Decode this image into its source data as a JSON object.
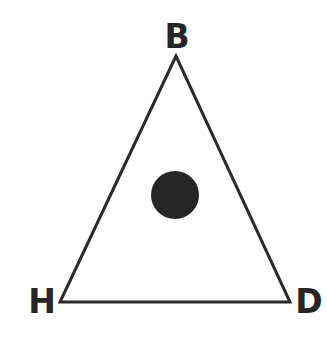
{
  "diagram": {
    "type": "triangle-with-point",
    "vertices": [
      {
        "label": "B",
        "position": "top"
      },
      {
        "label": "H",
        "position": "bottom-left"
      },
      {
        "label": "D",
        "position": "bottom-right"
      }
    ],
    "center_point": {
      "shape": "filled-circle"
    },
    "colors": {
      "stroke": "#2a2a2a",
      "dot": "#262626",
      "label": "#262626",
      "background": "#ffffff"
    }
  }
}
